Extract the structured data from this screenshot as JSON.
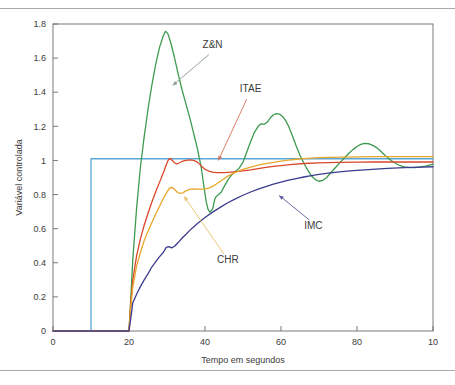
{
  "figure": {
    "has_top_rule": true,
    "has_bottom_rule": true,
    "background": "#ffffff",
    "frame_color": "#6b6b6b"
  },
  "chart_data": {
    "type": "line",
    "title": "",
    "subtitle": "",
    "xlabel": "Tempo em segundos",
    "ylabel": "Variável controlada",
    "xlim": [
      0,
      100
    ],
    "ylim": [
      0,
      1.8
    ],
    "grid": false,
    "legend_position": "inline-annotations",
    "xticks": [
      0,
      20,
      40,
      60,
      80,
      100
    ],
    "xticklabels": [
      "0",
      "20",
      "40",
      "60",
      "80",
      "10"
    ],
    "yticks": [
      0,
      0.2,
      0.4,
      0.6,
      0.8,
      1,
      1.2,
      1.4,
      1.6,
      1.8
    ],
    "yticklabels": [
      "0",
      "0.2",
      "0.4",
      "0.6",
      "0.8",
      "1",
      "1.2",
      "1.4",
      "1.6",
      "1.8"
    ],
    "series": [
      {
        "name": "Setpoint",
        "label": "",
        "color": "#5aa8d8",
        "annotated": false,
        "points": [
          [
            0,
            0
          ],
          [
            10,
            0
          ],
          [
            10,
            1.01
          ],
          [
            100,
            1.01
          ]
        ]
      },
      {
        "name": "Z&N",
        "label": "Z&N",
        "color": "#3d9b4f",
        "annotated": true,
        "label_x": 42,
        "label_y": 1.66,
        "leader_color": "#8a9a92",
        "leader_from": [
          41,
          1.62
        ],
        "leader_to": [
          31.5,
          1.44
        ],
        "points": [
          [
            0,
            0
          ],
          [
            20,
            0
          ],
          [
            20.3,
            0.12
          ],
          [
            21,
            0.42
          ],
          [
            22,
            0.72
          ],
          [
            23,
            0.96
          ],
          [
            24,
            1.14
          ],
          [
            25,
            1.3
          ],
          [
            26,
            1.44
          ],
          [
            27,
            1.56
          ],
          [
            28,
            1.66
          ],
          [
            29,
            1.73
          ],
          [
            29.6,
            1.757
          ],
          [
            30.2,
            1.745
          ],
          [
            31,
            1.69
          ],
          [
            32,
            1.6
          ],
          [
            33,
            1.5
          ],
          [
            34,
            1.41
          ],
          [
            35,
            1.33
          ],
          [
            36,
            1.25
          ],
          [
            37,
            1.16
          ],
          [
            38,
            1.07
          ],
          [
            39,
            0.96
          ],
          [
            39.7,
            0.85
          ],
          [
            40.3,
            0.76
          ],
          [
            40.8,
            0.713
          ],
          [
            41.3,
            0.697
          ],
          [
            42,
            0.715
          ],
          [
            42.6,
            0.775
          ],
          [
            43,
            0.79
          ],
          [
            43.6,
            0.8
          ],
          [
            44.3,
            0.815
          ],
          [
            45,
            0.845
          ],
          [
            46,
            0.885
          ],
          [
            47,
            0.915
          ],
          [
            48,
            0.935
          ],
          [
            49,
            0.955
          ],
          [
            50,
            0.99
          ],
          [
            51,
            1.05
          ],
          [
            52,
            1.11
          ],
          [
            53,
            1.165
          ],
          [
            54,
            1.2
          ],
          [
            54.8,
            1.215
          ],
          [
            55.6,
            1.212
          ],
          [
            56.4,
            1.225
          ],
          [
            57.2,
            1.25
          ],
          [
            58,
            1.268
          ],
          [
            58.8,
            1.275
          ],
          [
            59.6,
            1.272
          ],
          [
            60.4,
            1.258
          ],
          [
            61.2,
            1.235
          ],
          [
            62,
            1.2
          ],
          [
            63,
            1.145
          ],
          [
            64,
            1.085
          ],
          [
            65,
            1.03
          ],
          [
            66,
            0.985
          ],
          [
            67,
            0.945
          ],
          [
            68,
            0.91
          ],
          [
            69,
            0.888
          ],
          [
            70,
            0.878
          ],
          [
            71,
            0.883
          ],
          [
            72,
            0.9
          ],
          [
            73,
            0.925
          ],
          [
            74,
            0.95
          ],
          [
            75,
            0.975
          ],
          [
            76,
            0.999
          ],
          [
            77,
            1.022
          ],
          [
            78,
            1.045
          ],
          [
            79,
            1.065
          ],
          [
            80,
            1.082
          ],
          [
            81,
            1.094
          ],
          [
            82,
            1.1
          ],
          [
            83,
            1.098
          ],
          [
            84,
            1.09
          ],
          [
            85,
            1.078
          ],
          [
            86,
            1.06
          ],
          [
            87,
            1.038
          ],
          [
            88,
            1.018
          ],
          [
            89,
            1.0
          ],
          [
            90,
            0.985
          ],
          [
            91,
            0.973
          ],
          [
            92,
            0.965
          ],
          [
            93,
            0.96
          ],
          [
            94,
            0.958
          ],
          [
            95,
            0.958
          ],
          [
            96,
            0.96
          ],
          [
            97,
            0.963
          ],
          [
            98,
            0.967
          ],
          [
            99,
            0.972
          ],
          [
            100,
            0.978
          ]
        ]
      },
      {
        "name": "ITAE",
        "label": "ITAE",
        "color": "#d8472a",
        "annotated": true,
        "label_x": 52,
        "label_y": 1.4,
        "leader_color": "#d8715a",
        "leader_from": [
          51,
          1.36
        ],
        "leader_to": [
          43.5,
          1.0
        ],
        "points": [
          [
            0,
            0
          ],
          [
            20,
            0
          ],
          [
            20.4,
            0.14
          ],
          [
            21,
            0.3
          ],
          [
            22,
            0.44
          ],
          [
            23,
            0.54
          ],
          [
            24,
            0.62
          ],
          [
            25,
            0.69
          ],
          [
            26,
            0.755
          ],
          [
            27,
            0.815
          ],
          [
            28,
            0.87
          ],
          [
            29,
            0.925
          ],
          [
            29.8,
            0.975
          ],
          [
            30.4,
            1.005
          ],
          [
            30.9,
            1.012
          ],
          [
            31.4,
            1.0
          ],
          [
            32,
            0.985
          ],
          [
            32.6,
            0.98
          ],
          [
            33.2,
            0.985
          ],
          [
            34,
            0.995
          ],
          [
            35,
            1.0
          ],
          [
            36,
            1.003
          ],
          [
            37,
            1.0
          ],
          [
            38,
            0.99
          ],
          [
            39,
            0.968
          ],
          [
            40,
            0.948
          ],
          [
            41,
            0.938
          ],
          [
            42,
            0.932
          ],
          [
            43,
            0.929
          ],
          [
            44,
            0.928
          ],
          [
            45,
            0.928
          ],
          [
            46,
            0.93
          ],
          [
            47,
            0.932
          ],
          [
            48,
            0.934
          ],
          [
            49,
            0.936
          ],
          [
            50,
            0.939
          ],
          [
            52,
            0.945
          ],
          [
            54,
            0.952
          ],
          [
            56,
            0.959
          ],
          [
            58,
            0.965
          ],
          [
            60,
            0.97
          ],
          [
            63,
            0.977
          ],
          [
            66,
            0.982
          ],
          [
            70,
            0.986
          ],
          [
            75,
            0.989
          ],
          [
            80,
            0.99
          ],
          [
            85,
            0.991
          ],
          [
            90,
            0.991
          ],
          [
            95,
            0.991
          ],
          [
            100,
            0.991
          ]
        ]
      },
      {
        "name": "CHR",
        "label": "CHR",
        "color": "#e8a62a",
        "annotated": true,
        "label_x": 46,
        "label_y": 0.4,
        "leader_color": "#e8c06a",
        "leader_from": [
          45,
          0.45
        ],
        "leader_to": [
          34.5,
          0.79
        ],
        "points": [
          [
            0,
            0
          ],
          [
            20,
            0
          ],
          [
            20.4,
            0.12
          ],
          [
            21,
            0.26
          ],
          [
            22,
            0.38
          ],
          [
            23,
            0.46
          ],
          [
            24,
            0.53
          ],
          [
            25,
            0.585
          ],
          [
            26,
            0.635
          ],
          [
            27,
            0.685
          ],
          [
            28,
            0.73
          ],
          [
            29,
            0.775
          ],
          [
            30,
            0.815
          ],
          [
            30.8,
            0.84
          ],
          [
            31.5,
            0.84
          ],
          [
            32.2,
            0.825
          ],
          [
            32.8,
            0.812
          ],
          [
            33.4,
            0.807
          ],
          [
            34.2,
            0.81
          ],
          [
            35,
            0.822
          ],
          [
            36,
            0.83
          ],
          [
            37,
            0.833
          ],
          [
            38,
            0.832
          ],
          [
            39,
            0.832
          ],
          [
            40,
            0.833
          ],
          [
            41,
            0.838
          ],
          [
            42,
            0.848
          ],
          [
            43,
            0.862
          ],
          [
            44,
            0.878
          ],
          [
            45,
            0.893
          ],
          [
            46,
            0.908
          ],
          [
            47,
            0.92
          ],
          [
            48,
            0.93
          ],
          [
            49,
            0.939
          ],
          [
            50,
            0.947
          ],
          [
            52,
            0.961
          ],
          [
            54,
            0.972
          ],
          [
            56,
            0.981
          ],
          [
            58,
            0.989
          ],
          [
            60,
            0.996
          ],
          [
            62,
            1.002
          ],
          [
            64,
            1.007
          ],
          [
            66,
            1.011
          ],
          [
            68,
            1.014
          ],
          [
            70,
            1.016
          ],
          [
            73,
            1.018
          ],
          [
            76,
            1.02
          ],
          [
            80,
            1.021
          ],
          [
            85,
            1.022
          ],
          [
            90,
            1.022
          ],
          [
            95,
            1.022
          ],
          [
            100,
            1.022
          ]
        ]
      },
      {
        "name": "IMC",
        "label": "IMC",
        "color": "#3b3b8f",
        "annotated": true,
        "label_x": 68.5,
        "label_y": 0.6,
        "leader_color": "#5a5a9a",
        "leader_from": [
          67.5,
          0.65
        ],
        "leader_to": [
          59.5,
          0.795
        ],
        "points": [
          [
            0,
            0
          ],
          [
            20,
            0
          ],
          [
            20.5,
            0.08
          ],
          [
            21,
            0.165
          ],
          [
            22,
            0.215
          ],
          [
            23,
            0.26
          ],
          [
            24,
            0.3
          ],
          [
            25,
            0.335
          ],
          [
            26,
            0.375
          ],
          [
            27,
            0.405
          ],
          [
            28,
            0.435
          ],
          [
            29,
            0.46
          ],
          [
            29.8,
            0.49
          ],
          [
            30.5,
            0.495
          ],
          [
            31.2,
            0.487
          ],
          [
            32,
            0.497
          ],
          [
            33,
            0.52
          ],
          [
            34,
            0.545
          ],
          [
            35,
            0.567
          ],
          [
            36,
            0.59
          ],
          [
            37,
            0.61
          ],
          [
            38,
            0.63
          ],
          [
            39,
            0.648
          ],
          [
            40,
            0.665
          ],
          [
            42,
            0.697
          ],
          [
            44,
            0.725
          ],
          [
            46,
            0.752
          ],
          [
            48,
            0.775
          ],
          [
            50,
            0.796
          ],
          [
            52,
            0.815
          ],
          [
            54,
            0.832
          ],
          [
            56,
            0.847
          ],
          [
            58,
            0.861
          ],
          [
            60,
            0.873
          ],
          [
            62,
            0.884
          ],
          [
            64,
            0.894
          ],
          [
            66,
            0.903
          ],
          [
            68,
            0.911
          ],
          [
            70,
            0.918
          ],
          [
            73,
            0.927
          ],
          [
            76,
            0.934
          ],
          [
            79,
            0.94
          ],
          [
            82,
            0.945
          ],
          [
            85,
            0.949
          ],
          [
            88,
            0.953
          ],
          [
            91,
            0.956
          ],
          [
            94,
            0.959
          ],
          [
            97,
            0.961
          ],
          [
            100,
            0.963
          ]
        ]
      }
    ]
  }
}
